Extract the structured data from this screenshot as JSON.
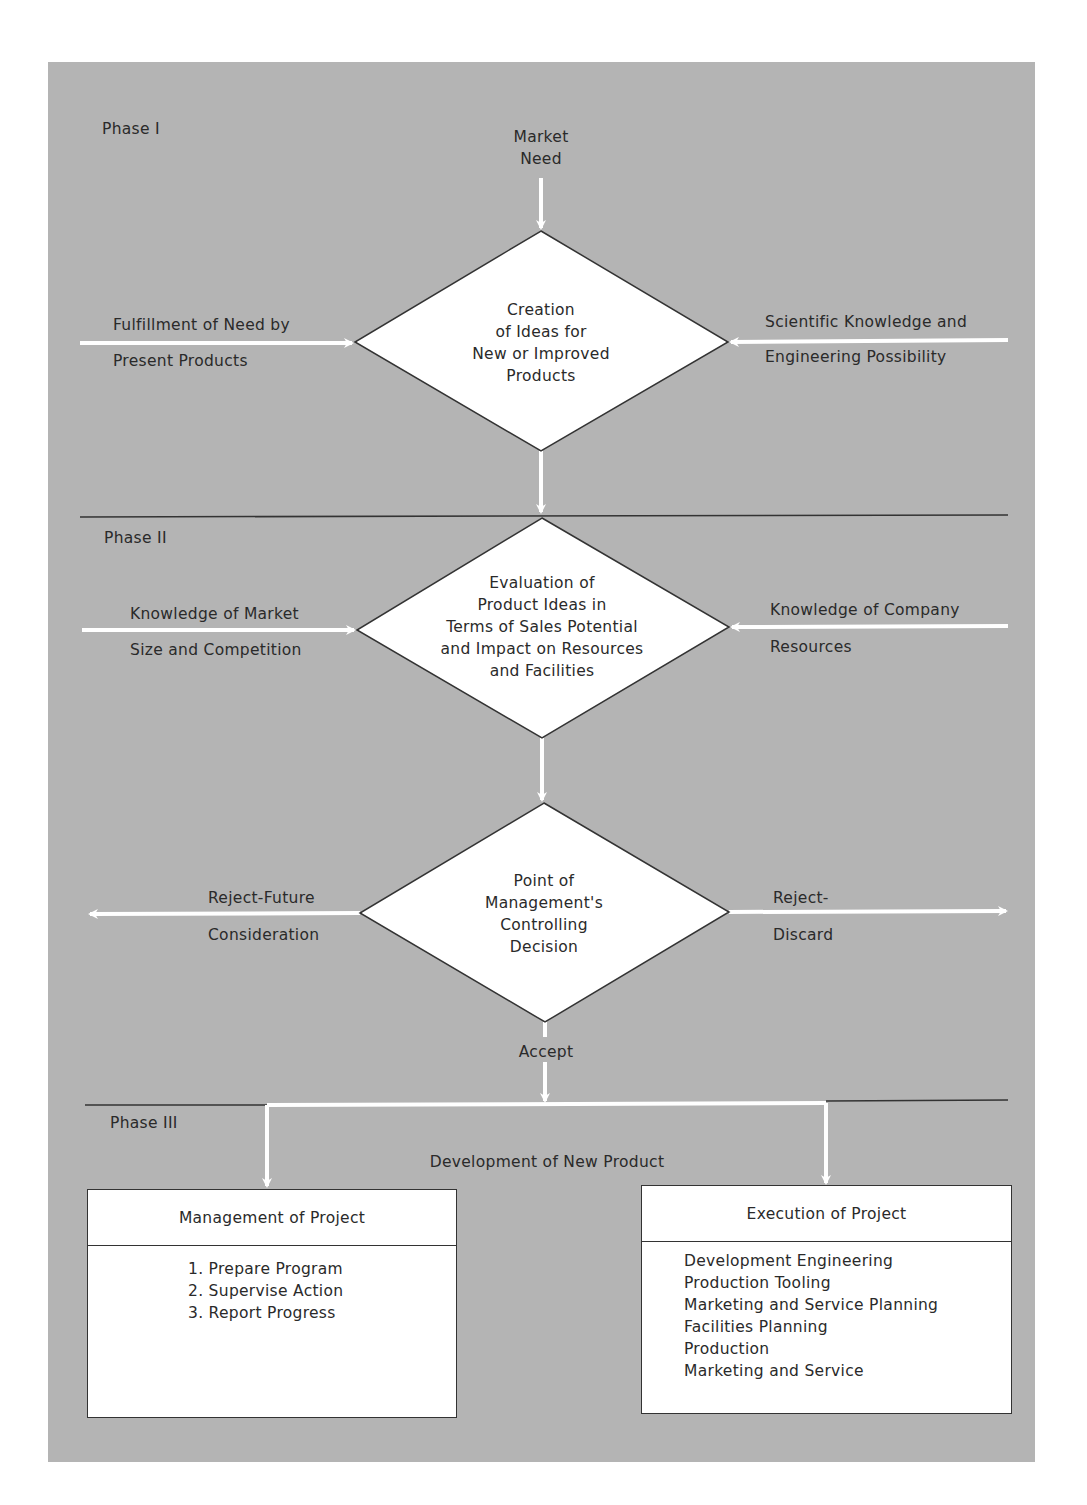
{
  "diagram": {
    "colors": {
      "panel_bg": "#b4b4b4",
      "shape_fill": "#ffffff",
      "stroke": "#333333",
      "arrow": "#ffffff"
    },
    "phases": [
      {
        "label": "Phase I"
      },
      {
        "label": "Phase II"
      },
      {
        "label": "Phase III"
      }
    ],
    "phase1": {
      "top_input": [
        "Market",
        "Need"
      ],
      "decision": [
        "Creation",
        "of Ideas for",
        "New or Improved",
        "Products"
      ],
      "left_input": [
        "Fulfillment of Need by",
        "Present Products"
      ],
      "right_input": [
        "Scientific Knowledge and",
        "Engineering Possibility"
      ]
    },
    "phase2": {
      "decision": [
        "Evaluation of",
        "Product Ideas in",
        "Terms of Sales Potential",
        "and Impact on Resources",
        "and Facilities"
      ],
      "left_input": [
        "Knowledge of Market",
        "Size and Competition"
      ],
      "right_input": [
        "Knowledge of Company",
        "Resources"
      ],
      "control": {
        "decision": [
          "Point of",
          "Management's",
          "Controlling",
          "Decision"
        ],
        "left_output": [
          "Reject-Future",
          "Consideration"
        ],
        "right_output": [
          "Reject-",
          "Discard"
        ],
        "down_output": "Accept"
      }
    },
    "phase3": {
      "title": "Development of New Product",
      "boxes": [
        {
          "title": "Management of Project",
          "items": [
            "1.  Prepare Program",
            "2.  Supervise Action",
            "3.  Report Progress"
          ]
        },
        {
          "title": "Execution of Project",
          "items": [
            "Development Engineering",
            "Production Tooling",
            "Marketing and Service Planning",
            "Facilities Planning",
            "Production",
            "Marketing and Service"
          ]
        }
      ]
    }
  }
}
